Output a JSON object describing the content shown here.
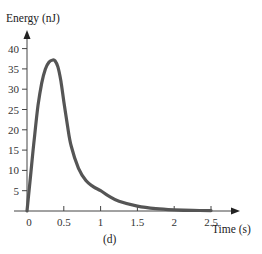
{
  "chart_data": {
    "type": "line",
    "title": "",
    "caption": "(d)",
    "xlabel": "Time (s)",
    "ylabel": "Energy (nJ)",
    "xlim": [
      0,
      2.6
    ],
    "ylim": [
      0,
      42
    ],
    "x_ticks": [
      0,
      0.5,
      1,
      1.5,
      2,
      2.5
    ],
    "x_tick_labels": [
      "0",
      "0.5",
      "1",
      "1.5",
      "2",
      "2.5"
    ],
    "y_ticks": [
      5,
      10,
      15,
      20,
      25,
      30,
      35,
      40
    ],
    "y_tick_labels": [
      "5",
      "10",
      "15",
      "20",
      "25",
      "30",
      "35",
      "40"
    ],
    "grid": false,
    "legend": null,
    "series": [
      {
        "name": "Energy",
        "color": "#555555",
        "x": [
          0,
          0.05,
          0.1,
          0.15,
          0.2,
          0.25,
          0.3,
          0.35,
          0.38,
          0.42,
          0.46,
          0.5,
          0.55,
          0.6,
          0.7,
          0.8,
          0.9,
          1.0,
          1.1,
          1.25,
          1.5,
          1.75,
          2.0,
          2.25,
          2.5
        ],
        "values": [
          0,
          9,
          18,
          26,
          31.5,
          35,
          36.7,
          37.2,
          37,
          35.5,
          32,
          27,
          21,
          16,
          10.5,
          7.5,
          6,
          5,
          3.8,
          2.4,
          1.2,
          0.6,
          0.3,
          0.15,
          0.1
        ]
      }
    ]
  }
}
